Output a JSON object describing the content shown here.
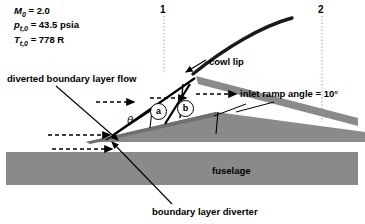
{
  "figure": {
    "type": "supersonic-inlet-schematic"
  },
  "flight_conditions": {
    "mach_symbol": "M",
    "mach_sub": "0",
    "mach_value": "= 2.0",
    "pressure_symbol": "p",
    "pressure_sub": "t,0",
    "pressure_value": "= 43.5 psia",
    "temperature_symbol": "T",
    "temperature_sub": "t,0",
    "temperature_value": "= 778 R"
  },
  "stations": {
    "station_1": "1",
    "station_2": "2"
  },
  "labels": {
    "diverted_flow": "diverted boundary layer flow",
    "cowl_lip": "cowl lip",
    "ramp_angle": "inlet ramp angle = 10°",
    "fuselage": "fuselage",
    "diverter": "boundary layer diverter",
    "theta": "θ",
    "region_a": "a",
    "region_b": "b"
  },
  "colors": {
    "ink": "#000000",
    "fuselage_gray": "#8a8a8a",
    "ramp_gray": "#8a8a8a",
    "background": "#ffffff"
  }
}
